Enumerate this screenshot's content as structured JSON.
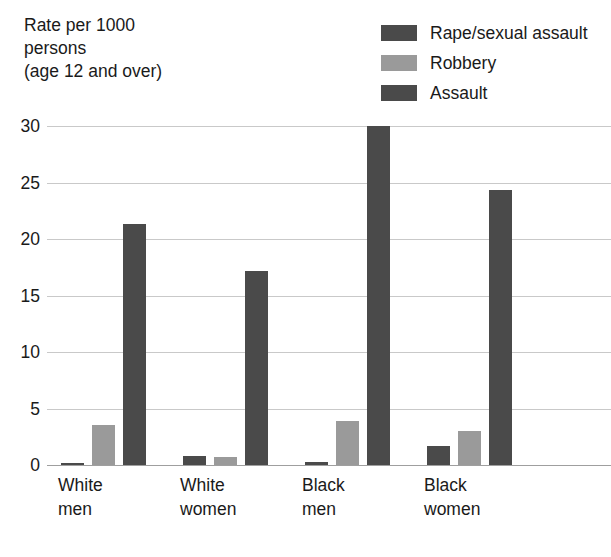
{
  "chart_data": {
    "type": "bar",
    "title": "",
    "subtitle": "",
    "ylabel": "Rate per 1000\npersons\n(age 12 and over)",
    "xlabel": "",
    "ylim": [
      0,
      30
    ],
    "yticks": [
      0,
      5,
      10,
      15,
      20,
      25,
      30
    ],
    "ytick_labels": [
      "0",
      "5",
      "10",
      "15",
      "20",
      "25",
      "30"
    ],
    "grid": true,
    "legend_position": "top-right",
    "categories": [
      "White men",
      "White women",
      "Black men",
      "Black women"
    ],
    "category_lines": [
      [
        "White",
        "men"
      ],
      [
        "White",
        "women"
      ],
      [
        "Black",
        "men"
      ],
      [
        "Black",
        "women"
      ]
    ],
    "series": [
      {
        "name": "Rape/sexual assault",
        "color": "#4a4a4a",
        "values": [
          0.2,
          0.8,
          0.3,
          1.7
        ]
      },
      {
        "name": "Robbery",
        "color": "#9a9a9a",
        "values": [
          3.5,
          0.7,
          3.9,
          3.0
        ]
      },
      {
        "name": "Assault",
        "color": "#4a4a4a",
        "values": [
          21.3,
          17.2,
          30.0,
          24.3
        ]
      }
    ]
  },
  "colors": {
    "background": "#ffffff",
    "text": "#1a1a1a",
    "gridline": "#c9c9c9",
    "baseline": "#9f9f9f",
    "series_dark": "#4a4a4a",
    "series_light": "#9a9a9a"
  }
}
